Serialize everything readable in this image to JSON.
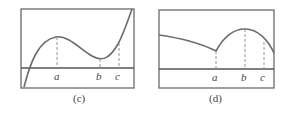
{
  "panels": [
    {
      "caption": "(c)",
      "description": "Cubic-like curve crossing axis near left, local max at a, local min at b, increasing through c",
      "labels": {
        "a": "a",
        "b": "b",
        "c": "c"
      }
    },
    {
      "caption": "(d)",
      "description": "Decreasing curve to a cusp (corner) at a, then rising to a smooth maximum at b, decreasing through c",
      "labels": {
        "a": "a",
        "b": "b",
        "c": "c"
      }
    }
  ]
}
